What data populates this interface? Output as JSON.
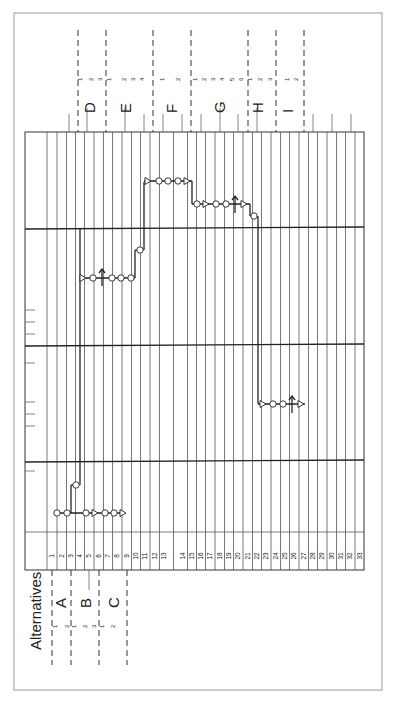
{
  "title": "Alternatives",
  "orientation": "rotated-90-ccw",
  "rows": [
    "1",
    "2",
    "3",
    "4",
    "5",
    "6",
    "7",
    "8",
    "9",
    "10",
    "11",
    "12",
    "13",
    "14",
    "15",
    "16",
    "17",
    "18",
    "19",
    "20",
    "21",
    "22",
    "23",
    "24",
    "25",
    "26",
    "27",
    "28",
    "29",
    "30",
    "31",
    "32",
    "33"
  ],
  "groups_left": [
    {
      "label": "A",
      "subs": [
        "1",
        "2"
      ]
    },
    {
      "label": "B",
      "subs": [
        "1",
        "2",
        "3"
      ]
    },
    {
      "label": "C",
      "subs": [
        "1",
        "2"
      ]
    }
  ],
  "groups_right": [
    {
      "label": "D",
      "subs": [
        "1",
        "2",
        "3"
      ]
    },
    {
      "label": "E",
      "subs": [
        "1",
        "2",
        "3",
        "4"
      ]
    },
    {
      "label": "F",
      "subs": [
        "1",
        "2"
      ]
    },
    {
      "label": "G",
      "subs": [
        "1",
        "2",
        "3",
        "4",
        "5",
        "6"
      ]
    },
    {
      "label": "H",
      "subs": [
        "1",
        "2",
        "3"
      ]
    },
    {
      "label": "I",
      "subs": [
        "1",
        "2"
      ]
    }
  ],
  "chains": [
    {
      "name": "A-B-C chain",
      "symbols": [
        "circle",
        "circle",
        "circle",
        "triangle",
        "circle",
        "circle",
        "triangle"
      ]
    },
    {
      "name": "D-E chain",
      "symbols": [
        "triangle",
        "circle",
        "arrow",
        "circle",
        "circle",
        "circle",
        "circle"
      ]
    },
    {
      "name": "F chain",
      "symbols": [
        "triangle",
        "circle",
        "circle",
        "circle",
        "triangle"
      ]
    },
    {
      "name": "G chain",
      "symbols": [
        "circle",
        "triangle",
        "circle",
        "circle",
        "arrow",
        "triangle",
        "circle"
      ]
    },
    {
      "name": "H-I chain",
      "symbols": [
        "triangle",
        "circle",
        "circle",
        "arrow",
        "triangle"
      ]
    }
  ]
}
